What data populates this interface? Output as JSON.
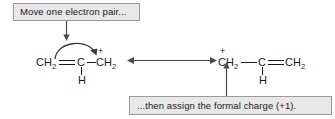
{
  "figure": {
    "background_color": "#ffffff",
    "ink_color": "#1a1a1a"
  },
  "callouts": {
    "top": {
      "text": "Move one electron pair...",
      "fill_color": "#e8e8e8",
      "border_color": "#9a9a9a"
    },
    "bottom": {
      "text": "...then assign the formal charge (+1).",
      "fill_color": "#e8e8e8",
      "border_color": "#9a9a9a"
    }
  },
  "resonance_arrow": {
    "name": "double-headed-resonance-arrow",
    "label": ""
  },
  "structures": {
    "left": {
      "name": "2-propenyl-cation-left",
      "atoms": {
        "terminal_ch2": "CH",
        "terminal_ch2_sub": "2",
        "center_c": "C",
        "cation_ch2": "CH",
        "cation_ch2_sub": "2",
        "charge": "+",
        "hydrogen": "H"
      }
    },
    "right": {
      "name": "2-propenyl-cation-right",
      "atoms": {
        "cation_ch2": "CH",
        "cation_ch2_sub": "2",
        "charge": "+",
        "center_c": "C",
        "terminal_ch2": "CH",
        "terminal_ch2_sub": "2",
        "hydrogen": "H"
      }
    }
  }
}
